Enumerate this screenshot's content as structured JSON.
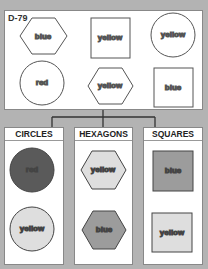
{
  "puzzle": {
    "id": "D-79",
    "unsorted_shapes": [
      {
        "shape": "hexagon",
        "label": "blue"
      },
      {
        "shape": "square",
        "label": "yellow"
      },
      {
        "shape": "circle",
        "label": "yellow"
      },
      {
        "shape": "circle",
        "label": "red"
      },
      {
        "shape": "hexagon",
        "label": "yellow"
      },
      {
        "shape": "square",
        "label": "blue"
      }
    ]
  },
  "categories": [
    {
      "title": "CIRCLES",
      "items": [
        {
          "label": "red",
          "fill": "#5a5a5a"
        },
        {
          "label": "yellow",
          "fill": "#dedede"
        }
      ]
    },
    {
      "title": "HEXAGONS",
      "items": [
        {
          "label": "yellow",
          "fill": "#dedede"
        },
        {
          "label": "blue",
          "fill": "#9c9c9c"
        }
      ]
    },
    {
      "title": "SQUARES",
      "items": [
        {
          "label": "blue",
          "fill": "#9c9c9c"
        },
        {
          "label": "yellow",
          "fill": "#dedede"
        }
      ]
    }
  ],
  "colors": {
    "background": "#b3b3b3",
    "panel": "#ffffff",
    "stroke": "#555555"
  }
}
